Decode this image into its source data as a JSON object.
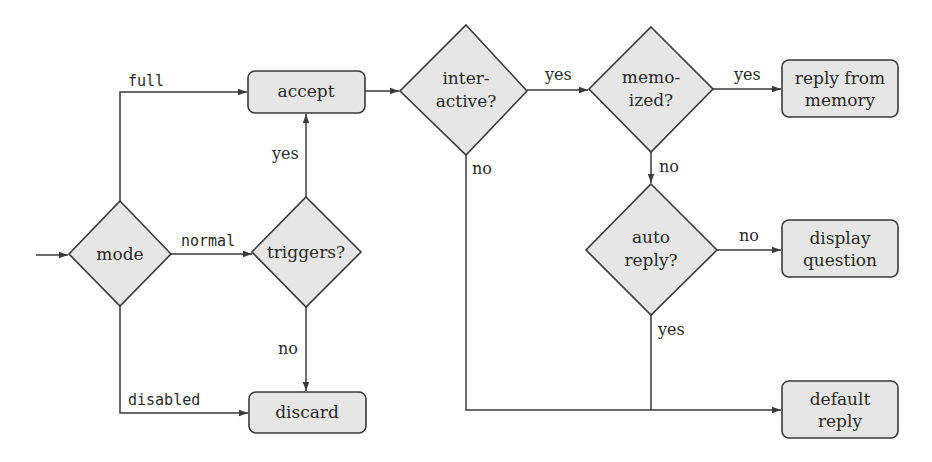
{
  "diagram": {
    "type": "flowchart",
    "colors": {
      "node_fill": "#e6e6e6",
      "stroke": "#3a3a3a",
      "text": "#2a2a2a",
      "background": "#ffffff"
    },
    "nodes": {
      "mode": {
        "shape": "diamond",
        "lines": [
          "mode"
        ]
      },
      "triggers": {
        "shape": "diamond",
        "lines": [
          "triggers?"
        ]
      },
      "accept": {
        "shape": "rounded-box",
        "lines": [
          "accept"
        ]
      },
      "discard": {
        "shape": "rounded-box",
        "lines": [
          "discard"
        ]
      },
      "interactive": {
        "shape": "diamond",
        "lines": [
          "inter-",
          "active?"
        ]
      },
      "memoized": {
        "shape": "diamond",
        "lines": [
          "memo-",
          "ized?"
        ]
      },
      "auto_reply": {
        "shape": "diamond",
        "lines": [
          "auto",
          "reply?"
        ]
      },
      "reply_from_memory": {
        "shape": "rounded-box",
        "lines": [
          "reply from",
          "memory"
        ]
      },
      "display_question": {
        "shape": "rounded-box",
        "lines": [
          "display",
          "question"
        ]
      },
      "default_reply": {
        "shape": "rounded-box",
        "lines": [
          "default",
          "reply"
        ]
      }
    },
    "edges": {
      "entry_to_mode": {
        "from": "entry",
        "to": "mode",
        "label": ""
      },
      "mode_full": {
        "from": "mode",
        "to": "accept",
        "label": "full"
      },
      "mode_normal": {
        "from": "mode",
        "to": "triggers",
        "label": "normal"
      },
      "mode_disabled": {
        "from": "mode",
        "to": "discard",
        "label": "disabled"
      },
      "triggers_yes": {
        "from": "triggers",
        "to": "accept",
        "label": "yes"
      },
      "triggers_no": {
        "from": "triggers",
        "to": "discard",
        "label": "no"
      },
      "accept_to_interactive": {
        "from": "accept",
        "to": "interactive",
        "label": ""
      },
      "interactive_yes": {
        "from": "interactive",
        "to": "memoized",
        "label": "yes"
      },
      "interactive_no": {
        "from": "interactive",
        "to": "default_reply",
        "label": "no"
      },
      "memoized_yes": {
        "from": "memoized",
        "to": "reply_from_memory",
        "label": "yes"
      },
      "memoized_no": {
        "from": "memoized",
        "to": "auto_reply",
        "label": "no"
      },
      "auto_reply_no": {
        "from": "auto_reply",
        "to": "display_question",
        "label": "no"
      },
      "auto_reply_yes": {
        "from": "auto_reply",
        "to": "default_reply",
        "label": "yes"
      }
    }
  }
}
